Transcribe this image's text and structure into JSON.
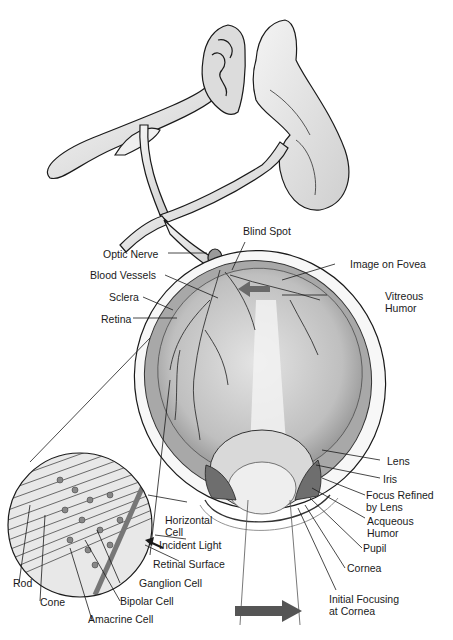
{
  "diagram": {
    "labels": {
      "optic_nerve": "Optic Nerve",
      "blind_spot": "Blind Spot",
      "blood_vessels": "Blood Vessels",
      "image_on_fovea": "Image on Fovea",
      "sclera": "Sclera",
      "vitreous_humor_1": "Vitreous",
      "vitreous_humor_2": "Humor",
      "retina": "Retina",
      "lens": "Lens",
      "iris": "Iris",
      "focus_refined_1": "Focus Refined",
      "focus_refined_2": "by Lens",
      "acqueous_humor_1": "Acqueous",
      "acqueous_humor_2": "Humor",
      "horizontal_cell_1": "Horizontal",
      "horizontal_cell_2": "Cell",
      "incident_light": "Incident Light",
      "retinal_surface": "Retinal Surface",
      "pupil": "Pupil",
      "cornea": "Cornea",
      "ganglion_cell": "Ganglion Cell",
      "rod": "Rod",
      "bipolar_cell": "Bipolar Cell",
      "initial_focusing_1": "Initial Focusing",
      "initial_focusing_2": "at Cornea",
      "cone": "Cone",
      "amacrine_cell": "Amacrine Cell"
    },
    "colors": {
      "line": "#1a1a1a",
      "arrow": "#555555",
      "eye_fill": "#bdbdbd",
      "vitreous": "#d6d6d6",
      "light_beam": "#f2f2f2"
    }
  }
}
